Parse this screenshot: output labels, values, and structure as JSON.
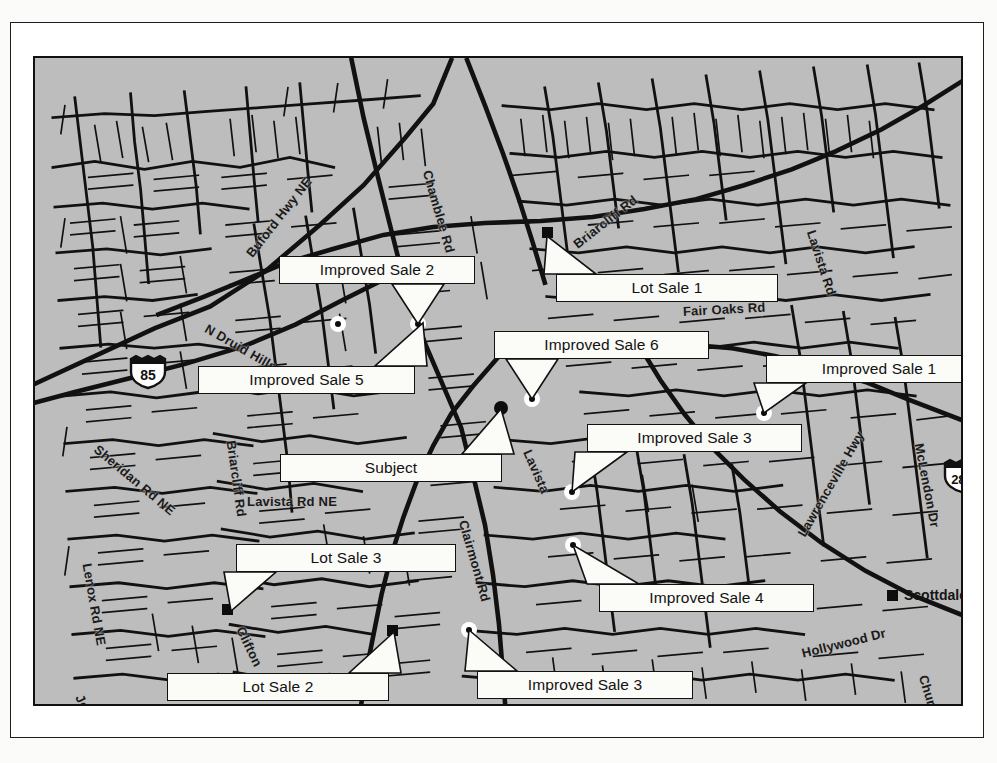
{
  "document": {
    "type": "appraisal-location-map",
    "background_color": "#bdbdbd",
    "ink_color": "#111111",
    "callout_fill": "#fbfbf7"
  },
  "map": {
    "title": "Location Map",
    "region": "Atlanta / DeKalb County, Georgia"
  },
  "callouts": [
    {
      "id": "improved-sale-2",
      "label": "Improved Sale 2",
      "x": 244,
      "y": 198,
      "w": 196,
      "h": 28,
      "target_x": 383,
      "target_y": 266
    },
    {
      "id": "lot-sale-1",
      "label": "Lot Sale 1",
      "x": 521,
      "y": 216,
      "w": 222,
      "h": 28,
      "target_x": 512,
      "target_y": 178
    },
    {
      "id": "improved-sale-6",
      "label": "Improved Sale 6",
      "x": 459,
      "y": 273,
      "w": 215,
      "h": 28,
      "target_x": 497,
      "target_y": 341
    },
    {
      "id": "improved-sale-1",
      "label": "Improved Sale 1",
      "x": 731,
      "y": 297,
      "w": 226,
      "h": 28,
      "target_x": 729,
      "target_y": 355
    },
    {
      "id": "improved-sale-5",
      "label": "Improved Sale 5",
      "x": 163,
      "y": 308,
      "w": 217,
      "h": 28,
      "target_x": 388,
      "target_y": 265
    },
    {
      "id": "improved-sale-3-upper",
      "label": "Improved Sale 3",
      "x": 552,
      "y": 366,
      "w": 215,
      "h": 28,
      "target_x": 537,
      "target_y": 434
    },
    {
      "id": "subject",
      "label": "Subject",
      "x": 245,
      "y": 396,
      "w": 222,
      "h": 28,
      "target_x": 466,
      "target_y": 351
    },
    {
      "id": "lot-sale-3",
      "label": "Lot Sale 3",
      "x": 201,
      "y": 486,
      "w": 220,
      "h": 28,
      "target_x": 196,
      "target_y": 553
    },
    {
      "id": "improved-sale-4",
      "label": "Improved Sale 4",
      "x": 564,
      "y": 526,
      "w": 215,
      "h": 28,
      "target_x": 538,
      "target_y": 487
    },
    {
      "id": "lot-sale-2",
      "label": "Lot Sale 2",
      "x": 132,
      "y": 615,
      "w": 222,
      "h": 28,
      "target_x": 359,
      "target_y": 574
    },
    {
      "id": "improved-sale-3-lower",
      "label": "Improved Sale 3",
      "x": 442,
      "y": 613,
      "w": 216,
      "h": 28,
      "target_x": 434,
      "target_y": 572
    }
  ],
  "markers": [
    {
      "id": "lot-sale-1-marker",
      "kind": "square",
      "x": 512,
      "y": 174
    },
    {
      "id": "lot-sale-3-marker",
      "kind": "square",
      "x": 192,
      "y": 551
    },
    {
      "id": "lot-sale-2-marker",
      "kind": "square",
      "x": 357,
      "y": 572
    },
    {
      "id": "scottdale-marker",
      "kind": "square",
      "x": 857,
      "y": 537
    },
    {
      "id": "subject-marker",
      "kind": "dot",
      "x": 466,
      "y": 350
    },
    {
      "id": "avondale-marker",
      "kind": "small-dot",
      "x": 782,
      "y": 662
    },
    {
      "id": "improved-sale-2-marker",
      "kind": "target",
      "x": 383,
      "y": 266
    },
    {
      "id": "improved-sale-5-marker",
      "kind": "target",
      "x": 303,
      "y": 266
    },
    {
      "id": "improved-sale-6-marker",
      "kind": "target",
      "x": 497,
      "y": 341
    },
    {
      "id": "improved-sale-1-marker",
      "kind": "target",
      "x": 729,
      "y": 355
    },
    {
      "id": "improved-sale-3-upper-marker",
      "kind": "target",
      "x": 537,
      "y": 434
    },
    {
      "id": "improved-sale-4-marker",
      "kind": "target",
      "x": 538,
      "y": 487
    },
    {
      "id": "improved-sale-3-lower-marker",
      "kind": "target",
      "x": 434,
      "y": 572
    }
  ],
  "street_labels": [
    {
      "id": "buford-hwy-ne",
      "text": "Buford Hwy NE",
      "x": 214,
      "y": 190,
      "rot": -52
    },
    {
      "id": "chamblee-rd",
      "text": "Chamblee Rd",
      "x": 392,
      "y": 105,
      "rot": 74
    },
    {
      "id": "briarcliff-rd-n",
      "text": "Briarcliff Rd",
      "x": 540,
      "y": 180,
      "rot": -38
    },
    {
      "id": "lavista-rd-e",
      "text": "Lavista Rd",
      "x": 776,
      "y": 165,
      "rot": 72
    },
    {
      "id": "fair-oaks-rd",
      "text": "Fair Oaks Rd",
      "x": 648,
      "y": 246,
      "rot": -3
    },
    {
      "id": "n-druid-hills-rd",
      "text": "N Druid Hills Rd",
      "x": 171,
      "y": 262,
      "rot": 30
    },
    {
      "id": "sheridan-rd-ne",
      "text": "Sheridan Rd NE",
      "x": 61,
      "y": 382,
      "rot": 40
    },
    {
      "id": "briarcliff-rd-w",
      "text": "Briarcliff Rd",
      "x": 196,
      "y": 375,
      "rot": 82
    },
    {
      "id": "lavista-rd-ne",
      "text": "Lavista Rd NE",
      "x": 212,
      "y": 436,
      "rot": 0
    },
    {
      "id": "lenox-rd-ne",
      "text": "Lenox Rd NE",
      "x": 52,
      "y": 498,
      "rot": 80
    },
    {
      "id": "lavista",
      "text": "Lavista",
      "x": 492,
      "y": 385,
      "rot": 66
    },
    {
      "id": "clairmont-rd",
      "text": "Clairmont Rd",
      "x": 428,
      "y": 455,
      "rot": 74
    },
    {
      "id": "clifton",
      "text": "Clifton",
      "x": 205,
      "y": 562,
      "rot": 64
    },
    {
      "id": "johnson-rd",
      "text": "Johnson Rd",
      "x": 44,
      "y": 630,
      "rot": 63
    },
    {
      "id": "lawrenceville-hwy",
      "text": "Lawrenceville Hwy",
      "x": 766,
      "y": 470,
      "rot": -60
    },
    {
      "id": "mclendon-dr",
      "text": "McLendon Dr",
      "x": 884,
      "y": 378,
      "rot": 79
    },
    {
      "id": "hollywood-dr",
      "text": "Hollywood Dr",
      "x": 767,
      "y": 588,
      "rot": -14
    },
    {
      "id": "church-st",
      "text": "Church St",
      "x": 888,
      "y": 610,
      "rot": 73
    }
  ],
  "place_labels": [
    {
      "id": "scottdale",
      "text": "Scottdale",
      "x": 869,
      "y": 529
    },
    {
      "id": "avondale",
      "text": "Avondale",
      "x": 793,
      "y": 655
    }
  ],
  "shields": [
    {
      "id": "interstate-85",
      "number": "85",
      "x": 113,
      "y": 314
    },
    {
      "id": "interstate-285",
      "number": "285",
      "x": 927,
      "y": 418
    }
  ]
}
